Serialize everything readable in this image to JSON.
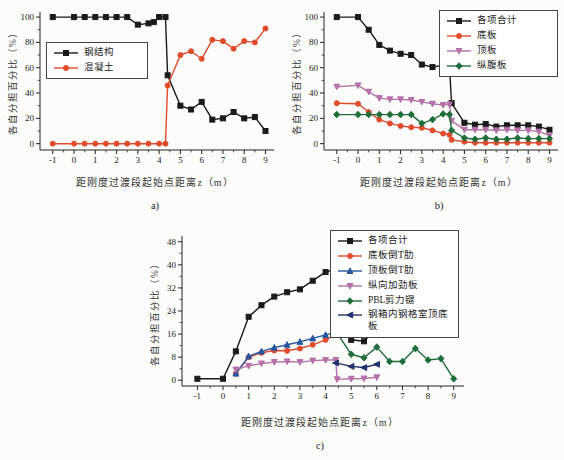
{
  "figure": {
    "background": "#fcfcfa"
  },
  "chart_data": [
    {
      "id": "a",
      "type": "line",
      "caption": "a)",
      "xlabel": "距刚度过渡段起始点距离z（m）",
      "ylabel": "各自分担百分比（%）",
      "xlim": [
        -1.6,
        9.4
      ],
      "ylim": [
        -5,
        104
      ],
      "xticks": [
        -1,
        0,
        1,
        2,
        3,
        4,
        5,
        6,
        7,
        8,
        9
      ],
      "yticks": [
        0,
        20,
        40,
        60,
        80,
        100
      ],
      "grid": "off",
      "legend_position": "inside-left-middle",
      "series": [
        {
          "name": "钢结构",
          "color": "#1a1a1a",
          "marker": "square",
          "points": [
            [
              -1,
              100
            ],
            [
              0,
              100
            ],
            [
              0.5,
              100
            ],
            [
              1,
              100
            ],
            [
              1.5,
              100
            ],
            [
              2,
              100
            ],
            [
              2.5,
              100
            ],
            [
              3,
              94
            ],
            [
              3.5,
              95
            ],
            [
              3.75,
              96
            ],
            [
              4,
              100
            ],
            [
              4.3,
              100
            ],
            [
              4.4,
              54
            ],
            [
              5,
              30
            ],
            [
              5.5,
              27
            ],
            [
              6,
              33
            ],
            [
              6.5,
              19
            ],
            [
              7,
              20
            ],
            [
              7.5,
              25
            ],
            [
              8,
              20
            ],
            [
              8.5,
              21
            ],
            [
              9,
              10
            ]
          ]
        },
        {
          "name": "混凝土",
          "color": "#e04b2c",
          "marker": "circle",
          "points": [
            [
              -1,
              0
            ],
            [
              0,
              0
            ],
            [
              0.5,
              0
            ],
            [
              1,
              0
            ],
            [
              1.5,
              0
            ],
            [
              2,
              0
            ],
            [
              2.5,
              0
            ],
            [
              3,
              0
            ],
            [
              3.5,
              0
            ],
            [
              4,
              0
            ],
            [
              4.3,
              0
            ],
            [
              4.4,
              46
            ],
            [
              5,
              70
            ],
            [
              5.5,
              73
            ],
            [
              6,
              67
            ],
            [
              6.5,
              82
            ],
            [
              7,
              81
            ],
            [
              7.5,
              75
            ],
            [
              8,
              81
            ],
            [
              8.5,
              80
            ],
            [
              9,
              91
            ]
          ]
        }
      ]
    },
    {
      "id": "b",
      "type": "line",
      "caption": "b)",
      "xlabel": "距刚度过渡段起始点距离z（m）",
      "ylabel": "各自分担百分比（%）",
      "xlim": [
        -1.6,
        9.4
      ],
      "ylim": [
        -5,
        104
      ],
      "xticks": [
        -1,
        0,
        1,
        2,
        3,
        4,
        5,
        6,
        7,
        8,
        9
      ],
      "yticks": [
        0,
        20,
        40,
        60,
        80,
        100
      ],
      "grid": "off",
      "legend_position": "inside-top-right",
      "series": [
        {
          "name": "各项合计",
          "color": "#1a1a1a",
          "marker": "square",
          "points": [
            [
              -1,
              100
            ],
            [
              0,
              100
            ],
            [
              0.5,
              90
            ],
            [
              1,
              78
            ],
            [
              1.5,
              73.5
            ],
            [
              2,
              71
            ],
            [
              2.5,
              70
            ],
            [
              3,
              62.5
            ],
            [
              3.5,
              60.5
            ],
            [
              4,
              62
            ],
            [
              4.3,
              60.5
            ],
            [
              4.4,
              32
            ],
            [
              5,
              16.5
            ],
            [
              5.5,
              15
            ],
            [
              6,
              15.5
            ],
            [
              6.5,
              13.5
            ],
            [
              7,
              14.5
            ],
            [
              7.5,
              14.5
            ],
            [
              8,
              14.5
            ],
            [
              8.5,
              13.5
            ],
            [
              9,
              11
            ]
          ]
        },
        {
          "name": "底板",
          "color": "#e04b2c",
          "marker": "circle",
          "points": [
            [
              -1,
              32
            ],
            [
              0,
              31.5
            ],
            [
              0.5,
              25
            ],
            [
              1,
              19
            ],
            [
              1.5,
              16
            ],
            [
              2,
              14
            ],
            [
              2.5,
              13
            ],
            [
              3,
              12.5
            ],
            [
              3.5,
              10.5
            ],
            [
              4,
              8
            ],
            [
              4.3,
              7
            ],
            [
              4.4,
              3
            ],
            [
              5,
              1.5
            ],
            [
              5.5,
              0.8
            ],
            [
              6,
              0.8
            ],
            [
              6.5,
              0.8
            ],
            [
              7,
              0.8
            ],
            [
              7.5,
              0.8
            ],
            [
              8,
              0.8
            ],
            [
              8.5,
              0.8
            ],
            [
              9,
              0.8
            ]
          ]
        },
        {
          "name": "顶板",
          "color": "#b470a8",
          "marker": "triangle-down",
          "points": [
            [
              -1,
              45
            ],
            [
              0,
              46
            ],
            [
              0.5,
              41
            ],
            [
              1,
              36
            ],
            [
              1.5,
              35
            ],
            [
              2,
              35
            ],
            [
              2.5,
              34.5
            ],
            [
              3,
              33
            ],
            [
              3.5,
              31.5
            ],
            [
              4,
              30.5
            ],
            [
              4.3,
              31
            ],
            [
              4.4,
              18
            ],
            [
              5,
              11
            ],
            [
              5.5,
              11
            ],
            [
              6,
              11
            ],
            [
              6.5,
              10.5
            ],
            [
              7,
              11
            ],
            [
              7.5,
              10.5
            ],
            [
              8,
              10.5
            ],
            [
              8.5,
              9.5
            ],
            [
              9,
              6.5
            ]
          ]
        },
        {
          "name": "纵腹板",
          "color": "#1e6e3c",
          "marker": "diamond",
          "points": [
            [
              -1,
              23
            ],
            [
              0,
              23
            ],
            [
              0.5,
              23
            ],
            [
              1,
              23
            ],
            [
              1.5,
              23
            ],
            [
              2,
              23
            ],
            [
              2.5,
              23
            ],
            [
              3,
              16
            ],
            [
              3.5,
              19
            ],
            [
              4,
              23.5
            ],
            [
              4.3,
              23
            ],
            [
              4.4,
              10.5
            ],
            [
              5,
              4.5
            ],
            [
              5.5,
              3.5
            ],
            [
              6,
              4.5
            ],
            [
              6.5,
              3.5
            ],
            [
              7,
              3.5
            ],
            [
              7.5,
              4.5
            ],
            [
              8,
              4
            ],
            [
              8.5,
              4
            ],
            [
              9,
              4
            ]
          ]
        }
      ]
    },
    {
      "id": "c",
      "type": "line",
      "caption": "c)",
      "xlabel": "距刚度过渡段起始点距离z（m）",
      "ylabel": "各自分担百分比（%）",
      "xlim": [
        -1.6,
        9.4
      ],
      "ylim": [
        -2,
        50
      ],
      "xticks": [
        -1,
        0,
        1,
        2,
        3,
        4,
        5,
        6,
        7,
        8,
        9
      ],
      "yticks": [
        0,
        8,
        16,
        24,
        32,
        40,
        48
      ],
      "grid": "off",
      "legend_position": "inside-top-right",
      "series": [
        {
          "name": "各项合计",
          "color": "#1a1a1a",
          "marker": "square",
          "points": [
            [
              -1,
              0.5
            ],
            [
              0,
              0.5
            ],
            [
              0.5,
              10
            ],
            [
              1,
              22
            ],
            [
              1.5,
              26
            ],
            [
              2,
              29
            ],
            [
              2.5,
              30.5
            ],
            [
              3,
              31.5
            ],
            [
              3.5,
              34.5
            ],
            [
              4,
              37.5
            ],
            [
              4.4,
              38.5
            ],
            [
              4.5,
              23
            ],
            [
              5,
              14
            ],
            [
              5.5,
              13.5
            ],
            [
              6,
              18
            ]
          ]
        },
        {
          "name": "底板倒T肋",
          "color": "#e04b2c",
          "marker": "circle",
          "points": [
            [
              0.5,
              2.3
            ],
            [
              1,
              8
            ],
            [
              1.5,
              9.5
            ],
            [
              2,
              10.3
            ],
            [
              2.5,
              10.2
            ],
            [
              3,
              11
            ],
            [
              3.5,
              12.3
            ],
            [
              4,
              14
            ],
            [
              4.4,
              15.7
            ]
          ]
        },
        {
          "name": "顶板倒T肋",
          "color": "#2457a0",
          "marker": "triangle-up",
          "points": [
            [
              0.5,
              2.3
            ],
            [
              1,
              8.3
            ],
            [
              1.5,
              10
            ],
            [
              2,
              11.3
            ],
            [
              2.5,
              12.3
            ],
            [
              3,
              13.3
            ],
            [
              3.5,
              14.5
            ],
            [
              4,
              15.7
            ],
            [
              4.4,
              16.5
            ]
          ]
        },
        {
          "name": "纵向加劲板",
          "color": "#b470a8",
          "marker": "triangle-down",
          "points": [
            [
              0.5,
              3.7
            ],
            [
              1,
              5
            ],
            [
              1.5,
              5.8
            ],
            [
              2,
              6.3
            ],
            [
              2.5,
              6.5
            ],
            [
              3,
              6.3
            ],
            [
              3.5,
              6.8
            ],
            [
              4,
              7
            ],
            [
              4.4,
              7
            ],
            [
              4.45,
              0.3
            ],
            [
              5,
              0.5
            ],
            [
              5.5,
              0.6
            ],
            [
              6,
              1
            ]
          ]
        },
        {
          "name": "PBL剪力键",
          "color": "#1e6e3c",
          "marker": "diamond",
          "points": [
            [
              4.4,
              17
            ],
            [
              5,
              9
            ],
            [
              5.5,
              7.8
            ],
            [
              6,
              11.5
            ],
            [
              6.5,
              6.5
            ],
            [
              7,
              6.5
            ],
            [
              7.5,
              11
            ],
            [
              8,
              7
            ],
            [
              8.5,
              7.5
            ],
            [
              9,
              0.5
            ]
          ]
        },
        {
          "name": "钢箱内钢格室顶底板",
          "color": "#20306e",
          "marker": "triangle-left",
          "points": [
            [
              4.4,
              6
            ],
            [
              5,
              4.8
            ],
            [
              5.5,
              4.4
            ],
            [
              6,
              5.5
            ]
          ]
        }
      ]
    }
  ]
}
